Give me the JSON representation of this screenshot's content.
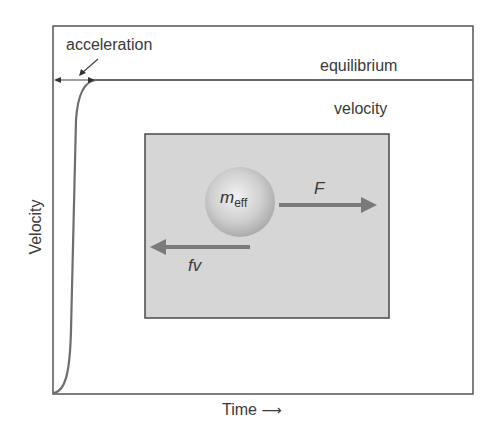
{
  "diagram": {
    "labels": {
      "acceleration": "acceleration",
      "equilibrium": "equilibrium",
      "velocity_top": "velocity",
      "y_axis": "Velocity",
      "x_axis": "Time",
      "x_axis_arrow": "⟶"
    },
    "inset": {
      "mass_symbol": "m",
      "mass_subscript": "eff",
      "force_label": "F",
      "drag_label": "fv"
    },
    "colors": {
      "frame": "#555555",
      "curve": "#6e6e6e",
      "inset_bg": "#d6d6d6",
      "arrow": "#7a7a7a",
      "sphere": "#c8c8c8"
    }
  }
}
